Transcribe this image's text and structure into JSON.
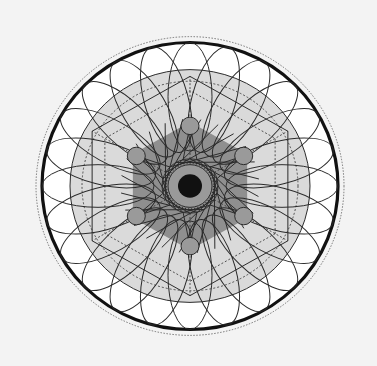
{
  "diagram": {
    "title": "Geometric mandala",
    "center": [
      190,
      186
    ],
    "scale": [
      1.0,
      0.97
    ],
    "colors": {
      "background": "#f3f3f3",
      "outer_fill": "#ffffff",
      "ring_fill": "#dadada",
      "hexagon_fill": "#8f8f8f",
      "node_fill": "#9a9a9a",
      "hub_ring_fill": "#9a9a9a",
      "core_fill": "#111111",
      "stroke": "#2a2a2a"
    },
    "outer_dotted_circle_r": 154,
    "outer_thick_circle_r": 148,
    "light_ring_outer_r": 120,
    "light_ring_dashed_r": 108,
    "outer_hexagon_r": 113,
    "inner_hexagon_r": 66,
    "node_orbit_r": 62,
    "node_r": 9,
    "node_count": 6,
    "petal_count": 24,
    "petal_orbit_r": 92,
    "petal_rx": 56,
    "petal_ry": 22,
    "spoke_count": 24,
    "hub_dashed_r": 28,
    "hub_ring_r": 22,
    "core_r": 12
  }
}
